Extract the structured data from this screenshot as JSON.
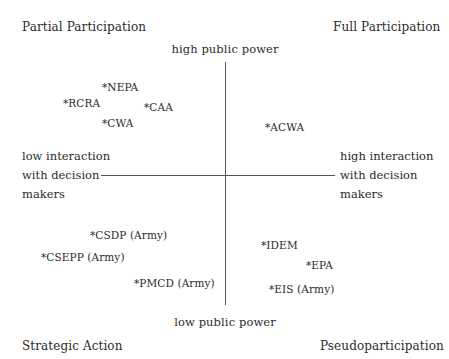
{
  "quadrants": {
    "top_left": "Partial Participation",
    "top_right": "Full Participation",
    "bottom_left": "Strategic Action",
    "bottom_right": "Pseudoparticipation"
  },
  "axes": {
    "vertical": {
      "top": "high public power",
      "bottom": "low public power"
    },
    "horizontal": {
      "left": [
        "low interaction",
        "with decision",
        "makers"
      ],
      "right": [
        "high interaction",
        "with decision",
        "makers"
      ]
    }
  },
  "items": [
    {
      "label": "*NEPA",
      "quadrant": "Partial Participation"
    },
    {
      "label": "*RCRA",
      "quadrant": "Partial Participation"
    },
    {
      "label": "*CAA",
      "quadrant": "Partial Participation"
    },
    {
      "label": "*CWA",
      "quadrant": "Partial Participation"
    },
    {
      "label": "*ACWA",
      "quadrant": "Full Participation"
    },
    {
      "label": "*CSDP (Army)",
      "quadrant": "Strategic Action"
    },
    {
      "label": "*CSEPP (Army)",
      "quadrant": "Strategic Action"
    },
    {
      "label": "*PMCD (Army)",
      "quadrant": "Strategic Action"
    },
    {
      "label": "*IDEM",
      "quadrant": "Pseudoparticipation"
    },
    {
      "label": "*EPA",
      "quadrant": "Pseudoparticipation"
    },
    {
      "label": "*EIS (Army)",
      "quadrant": "Pseudoparticipation"
    }
  ],
  "colors": {
    "text": "#2b2b2b",
    "axis": "#555555",
    "background": "#ffffff"
  }
}
